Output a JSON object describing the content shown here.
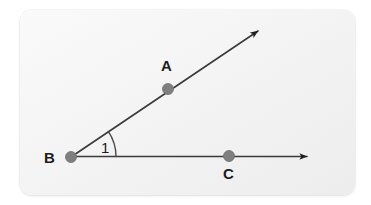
{
  "figure": {
    "canvas": {
      "width": 371,
      "height": 205
    },
    "card": {
      "x": 20,
      "y": 10,
      "width": 335,
      "height": 185,
      "corner_radius": 12,
      "background_start": "#fafafa",
      "background_end": "#ededed"
    },
    "stroke_color": "#333333",
    "stroke_width": 1.6,
    "point_color": "#7f7f7f",
    "point_stroke": "#6b6b6b",
    "point_radius": 5.5,
    "label_color": "#1c1c1c",
    "points": [
      {
        "name": "A",
        "label": "A",
        "x": 168,
        "y": 89,
        "label_x": 161,
        "label_y": 58
      },
      {
        "name": "B",
        "label": "B",
        "x": 71,
        "y": 157,
        "label_x": 44,
        "label_y": 150
      },
      {
        "name": "C",
        "label": "C",
        "x": 229,
        "y": 156,
        "label_x": 223,
        "label_y": 166
      }
    ],
    "rays": [
      {
        "name": "ray-BA",
        "from": "B",
        "through": "A",
        "x1": 71,
        "y1": 157,
        "x2": 262,
        "y2": 28,
        "arrowhead": "end"
      },
      {
        "name": "ray-BC",
        "from": "B",
        "through": "C",
        "x1": 71,
        "y1": 157,
        "x2": 312,
        "y2": 156,
        "arrowhead": "end"
      }
    ],
    "angle": {
      "name": "angle-1",
      "label": "1",
      "vertex": "B",
      "radius": 45,
      "start_deg": 0,
      "end_deg": 34,
      "label_x": 101,
      "label_y": 140
    }
  }
}
